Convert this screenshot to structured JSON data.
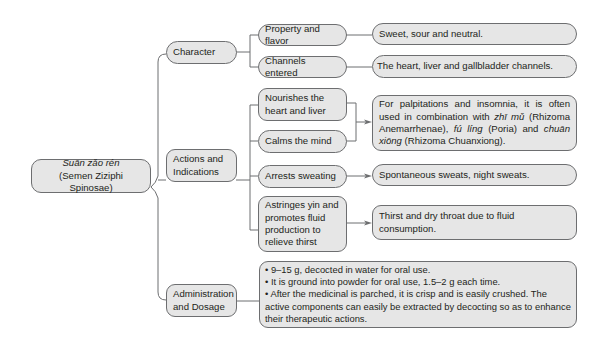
{
  "root": {
    "pinyin": "Suān zǎo rén",
    "latin": "(Semen Ziziphi Spinosae)"
  },
  "categories": [
    {
      "label": "Character"
    },
    {
      "label": "Actions and Indications"
    },
    {
      "label": "Administration and Dosage"
    }
  ],
  "character": {
    "items": [
      {
        "label": "Property and flavor",
        "detail": "Sweet, sour and neutral."
      },
      {
        "label": "Channels entered",
        "detail": "The heart, liver and gallbladder channels."
      }
    ]
  },
  "actions": {
    "items": [
      {
        "label": "Nourishes the heart and liver"
      },
      {
        "label": "Calms the mind"
      },
      {
        "label": "Arrests sweating"
      },
      {
        "label": "Astringes yin and promotes fluid production to relieve thirst"
      }
    ],
    "combined_detail": {
      "p1": "For palpitations and insomnia, it is often used in combination with ",
      "herb1": "zhī mǔ",
      "p2": " (Rhizoma Anemarrhenae), ",
      "herb2": "fú líng",
      "p3": " (Poria) and ",
      "herb3": "chuān xiōng",
      "p4": " (Rhizoma Chuanxiong)."
    },
    "sweating_detail": "Spontaneous sweats, night sweats.",
    "thirst_detail": "Thirst and dry throat due to fluid consumption."
  },
  "dosage": {
    "bullets": [
      "9–15 g, decocted in water for oral use.",
      "It is ground into powder for oral use, 1.5–2 g each time.",
      "After the medicinal is parched, it is crisp and is easily crushed. The active components can easily be extracted by decocting so as to enhance their therapeutic actions."
    ],
    "bullet_symbol": "•"
  },
  "colors": {
    "box_fill": "#e6e6e6",
    "box_border": "#6d6e70",
    "line": "#6d6e70"
  }
}
